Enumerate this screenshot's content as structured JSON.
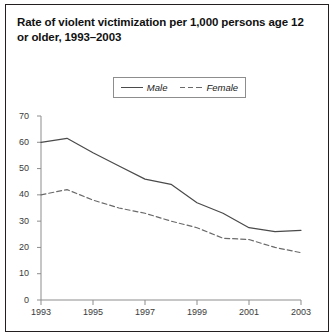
{
  "figure": {
    "title": "Rate of violent victimization per 1,000 persons age 12 or older, 1993–2003"
  },
  "legend": {
    "entries": [
      {
        "label": "Male",
        "style": "solid",
        "color": "#4a4a4a",
        "swatch_icon": "solid-line-icon"
      },
      {
        "label": "Female",
        "style": "dashed",
        "color": "#6a6a6a",
        "swatch_icon": "dashed-line-icon"
      }
    ]
  },
  "axes": {
    "y_ticks": [
      "70",
      "60",
      "50",
      "40",
      "30",
      "20",
      "10",
      "0"
    ],
    "x_ticks": [
      "1993",
      "1995",
      "1997",
      "1999",
      "2001",
      "2003"
    ]
  },
  "chart_data": {
    "type": "line",
    "title": "Rate of violent victimization per 1,000 persons age 12 or older, 1993–2003",
    "xlabel": "",
    "ylabel": "",
    "x": [
      1993,
      1994,
      1995,
      1996,
      1997,
      1998,
      1999,
      2000,
      2001,
      2002,
      2003
    ],
    "series": [
      {
        "name": "Male",
        "style": "solid",
        "color": "#4a4a4a",
        "values": [
          60.0,
          61.5,
          56.0,
          51.0,
          46.0,
          44.0,
          37.0,
          33.0,
          27.5,
          26.0,
          26.5
        ]
      },
      {
        "name": "Female",
        "style": "dashed",
        "color": "#6a6a6a",
        "values": [
          40.0,
          42.0,
          38.0,
          35.0,
          33.0,
          30.0,
          27.5,
          23.5,
          23.0,
          20.0,
          18.0
        ]
      }
    ],
    "xlim": [
      1993,
      2003
    ],
    "ylim": [
      0,
      70
    ],
    "y_tick_values": [
      0,
      10,
      20,
      30,
      40,
      50,
      60,
      70
    ],
    "x_tick_values": [
      1993,
      1995,
      1997,
      1999,
      2001,
      2003
    ],
    "grid": false,
    "legend_position": "top-center"
  }
}
